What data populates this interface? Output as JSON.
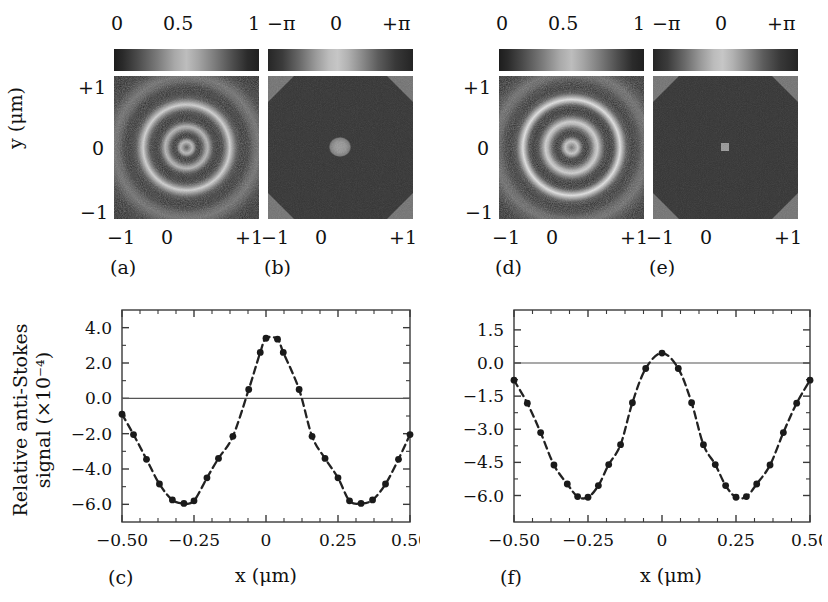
{
  "figure": {
    "panels": [
      "(a)",
      "(b)",
      "(c)",
      "(d)",
      "(e)",
      "(f)"
    ]
  },
  "image_panels": [
    {
      "letter": "(a)",
      "kind": "amplitude",
      "colorbar_ticks": [
        "0",
        "0.5",
        "1"
      ],
      "x_ticks": [
        "−1",
        "0",
        "+1"
      ],
      "y_ticks": [
        "+1",
        "0",
        "−1"
      ],
      "y_axis_label": "y (μm)",
      "content": "concentric-ring-airy-pattern"
    },
    {
      "letter": "(b)",
      "kind": "phase",
      "colorbar_ticks": [
        "−π",
        "0",
        "+π"
      ],
      "x_ticks": [
        "−1",
        "0",
        "+1"
      ],
      "y_ticks": [],
      "y_axis_label": "",
      "content": "dark-octagon-with-bright-center-spot"
    },
    {
      "letter": "(d)",
      "kind": "amplitude",
      "colorbar_ticks": [
        "0",
        "0.5",
        "1"
      ],
      "x_ticks": [
        "−1",
        "0",
        "+1"
      ],
      "y_ticks": [
        "+1",
        "0",
        "−1"
      ],
      "y_axis_label": "",
      "content": "concentric-ring-airy-pattern"
    },
    {
      "letter": "(e)",
      "kind": "phase",
      "colorbar_ticks": [
        "−π",
        "0",
        "+π"
      ],
      "x_ticks": [
        "−1",
        "0",
        "+1"
      ],
      "y_ticks": [],
      "y_axis_label": "",
      "content": "dark-octagon-with-small-bright-center-spot"
    }
  ],
  "chart_data": [
    {
      "panel": "(c)",
      "type": "line",
      "title": "",
      "xlabel": "x (μm)",
      "ylabel": "Relative anti-Stokes signal (×10⁻⁴)",
      "ylabel_line1": "Relative anti-Stokes",
      "ylabel_line2": "signal (×10⁻⁴)",
      "xlim": [
        -0.5,
        0.5
      ],
      "ylim": [
        -7.0,
        5.0
      ],
      "xticks": [
        -0.5,
        -0.25,
        0,
        0.25,
        0.5
      ],
      "xticklabels": [
        "−0.50",
        "−0.25",
        "0",
        "0.25",
        "0.50"
      ],
      "yticks": [
        4.0,
        2.0,
        0.0,
        -2.0,
        -4.0,
        -6.0
      ],
      "yticklabels": [
        "4.0",
        "2.0",
        "0.0",
        "−2.0",
        "−4.0",
        "−6.0"
      ],
      "grid": false,
      "legend": false,
      "zero_line": true,
      "marker": "filled-circle",
      "linestyle": "dashed",
      "series": [
        {
          "name": "relative anti-Stokes signal",
          "x": [
            -0.5,
            -0.46,
            -0.415,
            -0.37,
            -0.325,
            -0.285,
            -0.25,
            -0.205,
            -0.165,
            -0.115,
            -0.06,
            -0.02,
            0.0,
            0.04,
            0.06,
            0.115,
            0.16,
            0.205,
            0.25,
            0.29,
            0.33,
            0.37,
            0.415,
            0.46,
            0.5
          ],
          "y": [
            -0.9,
            -2.05,
            -3.45,
            -4.85,
            -5.75,
            -5.95,
            -5.8,
            -4.5,
            -3.4,
            -2.15,
            0.5,
            2.6,
            3.4,
            3.35,
            2.6,
            0.5,
            -2.15,
            -3.4,
            -4.5,
            -5.8,
            -5.95,
            -5.75,
            -4.85,
            -3.45,
            -2.05
          ]
        }
      ]
    },
    {
      "panel": "(f)",
      "type": "line",
      "title": "",
      "xlabel": "x (μm)",
      "ylabel": "",
      "xlim": [
        -0.5,
        0.5
      ],
      "ylim": [
        -7.2,
        2.4
      ],
      "xticks": [
        -0.5,
        -0.25,
        0,
        0.25,
        0.5
      ],
      "xticklabels": [
        "−0.50",
        "−0.25",
        "0",
        "0.25",
        "0.50"
      ],
      "yticks": [
        1.5,
        0.0,
        -1.5,
        -3.0,
        -4.5,
        -6.0
      ],
      "yticklabels": [
        "1.5",
        "0.0",
        "−1.5",
        "−3.0",
        "−4.5",
        "−6.0"
      ],
      "grid": false,
      "legend": false,
      "zero_line": true,
      "marker": "filled-circle",
      "linestyle": "dashed",
      "series": [
        {
          "name": "relative anti-Stokes signal",
          "x": [
            -0.5,
            -0.455,
            -0.41,
            -0.365,
            -0.32,
            -0.285,
            -0.25,
            -0.215,
            -0.18,
            -0.14,
            -0.1,
            -0.055,
            0.0,
            0.055,
            0.1,
            0.14,
            0.18,
            0.215,
            0.25,
            0.285,
            0.32,
            0.365,
            0.41,
            0.455,
            0.5
          ],
          "y": [
            -0.78,
            -1.82,
            -3.15,
            -4.62,
            -5.48,
            -6.05,
            -6.08,
            -5.55,
            -4.6,
            -3.7,
            -1.8,
            -0.25,
            0.45,
            -0.25,
            -1.8,
            -3.7,
            -4.6,
            -5.55,
            -6.08,
            -6.05,
            -5.48,
            -4.62,
            -3.15,
            -1.82,
            -0.78
          ]
        }
      ]
    }
  ]
}
